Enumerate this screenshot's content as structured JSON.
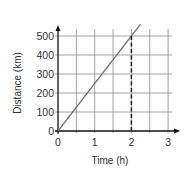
{
  "chart_data": {
    "type": "line",
    "title": "",
    "xlabel": "Time (h)",
    "ylabel": "Distance (km)",
    "xlim": [
      0,
      3
    ],
    "ylim": [
      0,
      500
    ],
    "x_ticks": [
      "0",
      "1",
      "2",
      "3"
    ],
    "y_ticks": [
      "0",
      "100",
      "200",
      "300",
      "400",
      "500"
    ],
    "grid": true,
    "grid_x_step": 0.5,
    "grid_y_step": 100,
    "series": [
      {
        "name": "Distance",
        "x": [
          0,
          0.5,
          1,
          1.5,
          2,
          2.25
        ],
        "values": [
          0,
          125,
          250,
          375,
          500,
          562.5
        ],
        "color": "#7a7a7a"
      }
    ],
    "annotations": [
      {
        "type": "dashed-vertical-line",
        "x": 2,
        "from_y": 0,
        "to_y": 500,
        "color": "#222222"
      }
    ],
    "legend": null
  }
}
